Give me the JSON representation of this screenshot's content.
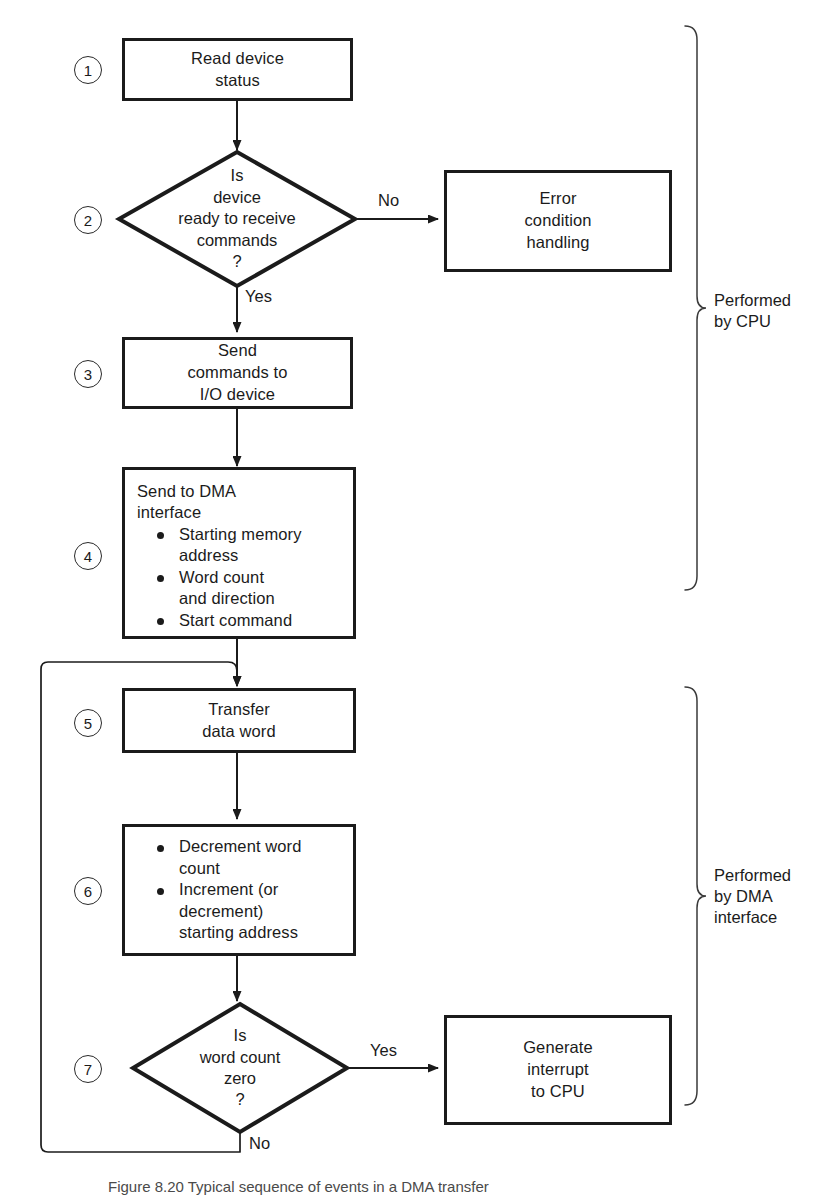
{
  "figure": {
    "caption": "Figure 8.20    Typical sequence of events in a DMA transfer"
  },
  "steps": [
    {
      "num": "1",
      "shape": "process",
      "text": "Read device\nstatus"
    },
    {
      "num": "2",
      "shape": "decision",
      "text": "Is\ndevice\nready to receive\ncommands\n?"
    },
    {
      "num": "3",
      "shape": "process",
      "text": "Send\ncommands to\nI/O device"
    },
    {
      "num": "4",
      "shape": "process-list",
      "headline": "Send to DMA\ninterface",
      "bullets": [
        "Starting memory\naddress",
        "Word count\nand direction",
        "Start command"
      ]
    },
    {
      "num": "5",
      "shape": "process",
      "text": "Transfer\ndata word"
    },
    {
      "num": "6",
      "shape": "process-list",
      "headline": "",
      "bullets": [
        "Decrement word\ncount",
        "Increment (or\ndecrement)\nstarting address"
      ]
    },
    {
      "num": "7",
      "shape": "decision",
      "text": "Is\nword count\nzero\n?"
    }
  ],
  "side_nodes": {
    "error": "Error\ncondition\nhandling",
    "interrupt": "Generate\ninterrupt\nto CPU"
  },
  "edge_labels": {
    "d2_no": "No",
    "d2_yes": "Yes",
    "d7_yes": "Yes",
    "d7_no": "No"
  },
  "brackets": [
    {
      "label": "Performed\nby CPU"
    },
    {
      "label": "Performed\nby DMA\ninterface"
    }
  ],
  "colors": {
    "ink": "#1b1b1b",
    "hairline": "#3a3a3a",
    "paper": "#ffffff"
  }
}
